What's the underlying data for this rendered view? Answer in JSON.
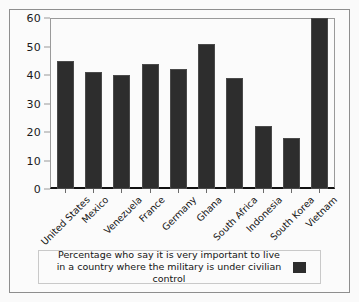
{
  "chart_data": {
    "type": "bar",
    "title": "",
    "subtitle": "",
    "xlabel": "",
    "ylabel": "",
    "ylim": [
      0,
      60
    ],
    "y_ticks": [
      0,
      10,
      20,
      30,
      40,
      50,
      60
    ],
    "grid": false,
    "legend_position": "bottom",
    "legend_entries": [
      "Percentage who say it is very important to live in a country where the military is under civilian control"
    ],
    "categories": [
      "United States",
      "Mexico",
      "Venezuela",
      "France",
      "Germany",
      "Ghana",
      "South Africa",
      "Indonesia",
      "South Korea",
      "Vietnam"
    ],
    "values": [
      45,
      41,
      40,
      44,
      42,
      51,
      39,
      22,
      18,
      60
    ],
    "series": [
      {
        "name": "Percentage who say it is very important to live in a country where the military is under civilian control",
        "values": [
          45,
          41,
          40,
          44,
          42,
          51,
          39,
          22,
          18,
          60
        ],
        "color": "#2d2d2d"
      }
    ]
  },
  "colors": {
    "bar": "#2d2d2d",
    "background": "#fbfbfb",
    "axis": "#111111",
    "frame": "#8e8e8e",
    "text": "#141414"
  },
  "legend": {
    "label": "Percentage who say it is very important to live in a country where the military is under civilian control"
  }
}
